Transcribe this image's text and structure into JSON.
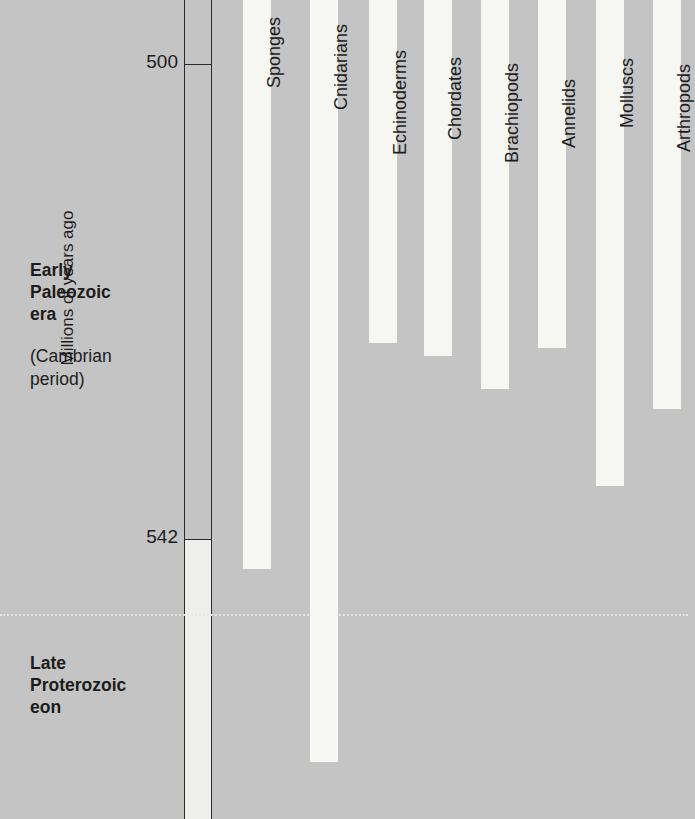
{
  "figure": {
    "axis_caption": "Millions of years ago",
    "eras": [
      {
        "id": "early-paleozoic",
        "title": "Early\nPaleozoic\nera",
        "subtitle": "(Cambrian\nperiod)"
      },
      {
        "id": "late-proterozoic",
        "title": "Late\nProterozoic\neon",
        "subtitle": ""
      }
    ],
    "colors": {
      "background": "#c4c4c4",
      "bar": "#f6f6f2",
      "axis_line": "#2b2b2b",
      "text": "#1c1c1c",
      "boundary_line": "#e8e8e6"
    }
  },
  "chart_data": {
    "type": "bar",
    "title": "",
    "subtitle": "",
    "orientation": "vertical-range",
    "xlabel": "",
    "ylabel": "Millions of years ago",
    "ylim": [
      494,
      561
    ],
    "y_axis_inverted": true,
    "grid": false,
    "legend": "none",
    "tick_labels": [
      "500",
      "542"
    ],
    "ticks": [
      500,
      542
    ],
    "annotations": [
      "Early Paleozoic era (Cambrian period)",
      "Late Proterozoic eon"
    ],
    "boundary_value": 548.6,
    "note": "Each bar is a fossil-record range: its top is the top of the plot (youngest, ~494 Ma) and its bottom marks the oldest known fossils of that phylum.",
    "categories": [
      "Sponges",
      "Cnidarians",
      "Echinoderms",
      "Chordates",
      "Brachiopods",
      "Annelids",
      "Molluscs",
      "Arthropods"
    ],
    "values": [
      542.6,
      559.8,
      524.7,
      525.8,
      528.7,
      525.1,
      537.3,
      530.5
    ],
    "series": [
      {
        "name": "Oldest fossil appearance (Ma)",
        "values": [
          542.6,
          559.8,
          524.7,
          525.8,
          528.7,
          525.1,
          537.3,
          530.5
        ]
      }
    ],
    "bars": [
      {
        "label": "Sponges",
        "oldest_ma": 542.6,
        "x": 243,
        "width": 28,
        "top": 0,
        "bottom": 569
      },
      {
        "label": "Cnidarians",
        "oldest_ma": 559.8,
        "x": 310,
        "width": 28,
        "top": 0,
        "bottom": 762
      },
      {
        "label": "Echinoderms",
        "oldest_ma": 524.7,
        "x": 369,
        "width": 28,
        "top": 0,
        "bottom": 343
      },
      {
        "label": "Chordates",
        "oldest_ma": 525.8,
        "x": 424,
        "width": 28,
        "top": 0,
        "bottom": 356
      },
      {
        "label": "Brachiopods",
        "oldest_ma": 528.7,
        "x": 481,
        "width": 28,
        "top": 0,
        "bottom": 389
      },
      {
        "label": "Annelids",
        "oldest_ma": 525.1,
        "x": 538,
        "width": 28,
        "top": 0,
        "bottom": 348
      },
      {
        "label": "Molluscs",
        "oldest_ma": 537.3,
        "x": 596,
        "width": 28,
        "top": 0,
        "bottom": 486
      },
      {
        "label": "Arthropods",
        "oldest_ma": 530.5,
        "x": 653,
        "width": 28,
        "top": 0,
        "bottom": 409
      }
    ],
    "label_tops": [
      88,
      110,
      155,
      140,
      163,
      148,
      128,
      152
    ]
  },
  "geometry": {
    "tick_500_y": 64,
    "tick_542_y": 539,
    "boundary_y": 614,
    "axis_outer_x": 184,
    "axis_inner_x": 211
  }
}
